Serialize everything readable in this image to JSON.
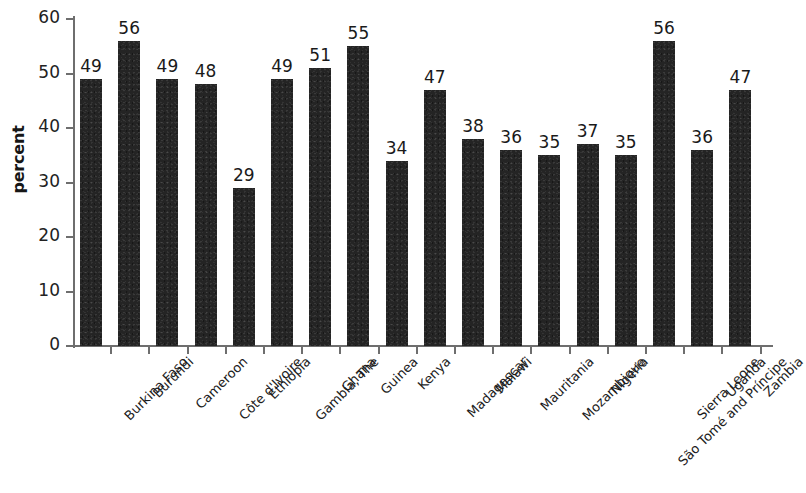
{
  "chart_data": {
    "type": "bar",
    "title": "",
    "subtitle": "",
    "xlabel": "",
    "ylabel": "percent",
    "ylim": [
      0,
      60
    ],
    "yticks": [
      0,
      10,
      20,
      30,
      40,
      50,
      60
    ],
    "grid": false,
    "legend": null,
    "bar_color": "#242424",
    "axis_color": "#6e6e6e",
    "categories": [
      "Burkina Faso",
      "Burundi",
      "Cameroon",
      "Côte d'Ivoire",
      "Ethiopia",
      "Gambia, The",
      "Ghana",
      "Guinea",
      "Kenya",
      "Madagascar",
      "Malawi",
      "Mauritania",
      "Mozambique",
      "Nigeria",
      "São Tomé and Príncipe",
      "Sierra Leone",
      "Uganda",
      "Zambia"
    ],
    "values": [
      49,
      56,
      49,
      48,
      29,
      49,
      51,
      55,
      34,
      47,
      38,
      36,
      35,
      37,
      35,
      56,
      36,
      47
    ],
    "data_labels": [
      "49",
      "56",
      "49",
      "48",
      "29",
      "49",
      "51",
      "55",
      "34",
      "47",
      "38",
      "36",
      "35",
      "37",
      "35",
      "56",
      "36",
      "47"
    ],
    "ytick_labels": [
      "0",
      "10",
      "20",
      "30",
      "40",
      "50",
      "60"
    ]
  }
}
